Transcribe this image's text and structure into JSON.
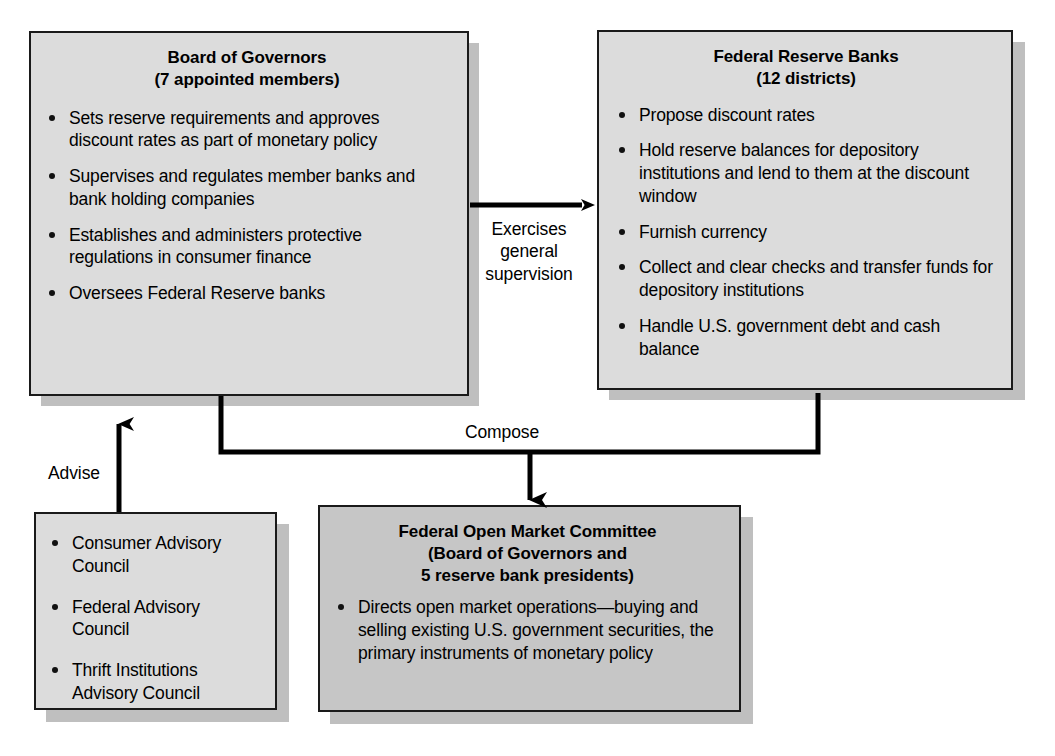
{
  "diagram": {
    "colors": {
      "box_fill_light": "#dcdcdc",
      "box_fill_dark": "#c6c6c6",
      "box_border": "#1a1a1a",
      "shadow": "#bfbfbf",
      "line": "#000000",
      "background": "#ffffff"
    }
  },
  "boxes": {
    "board_of_governors": {
      "title_line1": "Board of Governors",
      "title_line2": "(7 appointed members)",
      "bullets": [
        "Sets reserve requirements and approves discount rates as part of monetary policy",
        "Supervises and regulates member banks and bank holding companies",
        "Establishes and administers protective regulations in consumer finance",
        "Oversees Federal Reserve banks"
      ]
    },
    "federal_reserve_banks": {
      "title_line1": "Federal Reserve Banks",
      "title_line2": "(12 districts)",
      "bullets": [
        "Propose discount rates",
        "Hold reserve balances for depository institutions and lend to them at the discount window",
        "Furnish currency",
        "Collect and clear checks and transfer funds for depository institutions",
        "Handle U.S. government debt and cash balance"
      ]
    },
    "advisory_councils": {
      "bullets": [
        "Consumer Advisory Council",
        "Federal Advisory Council",
        "Thrift Institutions Advisory Council"
      ]
    },
    "fomc": {
      "title_line1": "Federal Open Market Committee",
      "title_line2": "(Board of Governors and",
      "title_line3": "5 reserve bank presidents)",
      "bullets": [
        "Directs open market operations—buying and selling existing U.S. government securities, the primary instruments of monetary policy"
      ]
    }
  },
  "connectors": {
    "supervision": {
      "label": "Exercises\ngeneral\nsupervision",
      "from": "board_of_governors",
      "to": "federal_reserve_banks"
    },
    "advise": {
      "label": "Advise",
      "from": "advisory_councils",
      "to": "board_of_governors"
    },
    "compose": {
      "label": "Compose",
      "from": "board_of_governors, federal_reserve_banks",
      "to": "fomc"
    }
  }
}
